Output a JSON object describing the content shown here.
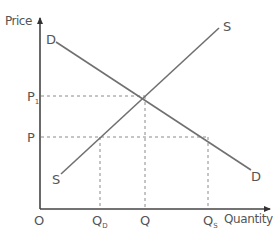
{
  "diagram": {
    "type": "supply-demand",
    "axes": {
      "y_label": "Price",
      "x_label": "Quantity",
      "origin_label": "O"
    },
    "curves": {
      "demand": {
        "start_label": "D",
        "end_label": "D"
      },
      "supply": {
        "start_label": "S",
        "end_label": "S"
      }
    },
    "price_levels": [
      {
        "label": "P",
        "subscript": "1",
        "role": "equilibrium price"
      },
      {
        "label": "P",
        "subscript": "",
        "role": "price below equilibrium"
      }
    ],
    "quantity_levels": [
      {
        "label": "Q",
        "subscript": "D",
        "role": "quantity demanded at P"
      },
      {
        "label": "Q",
        "subscript": "",
        "role": "equilibrium quantity"
      },
      {
        "label": "Q",
        "subscript": "S",
        "role": "quantity supplied at P"
      }
    ],
    "colors": {
      "axis": "#444444",
      "curve": "#707070",
      "guide": "#8a8a8a",
      "text": "#555555"
    }
  }
}
